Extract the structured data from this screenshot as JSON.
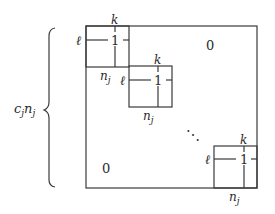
{
  "diagram": {
    "type": "block-diagonal-matrix",
    "side_label": {
      "c": "c",
      "c_sub": "j",
      "n": "n",
      "n_sub": "j"
    },
    "zero_labels": {
      "upper_right": "0",
      "lower_left": "0"
    },
    "ellipsis": "⋱",
    "blocks": [
      {
        "entry": "1",
        "row_label": "ℓ",
        "col_label": "k",
        "size_label": "n",
        "size_sub": "j"
      },
      {
        "entry": "1",
        "row_label": "ℓ",
        "col_label": "k",
        "size_label": "n",
        "size_sub": "j"
      },
      {
        "entry": "1",
        "row_label": "ℓ",
        "col_label": "k",
        "size_label": "n",
        "size_sub": "j"
      }
    ]
  }
}
